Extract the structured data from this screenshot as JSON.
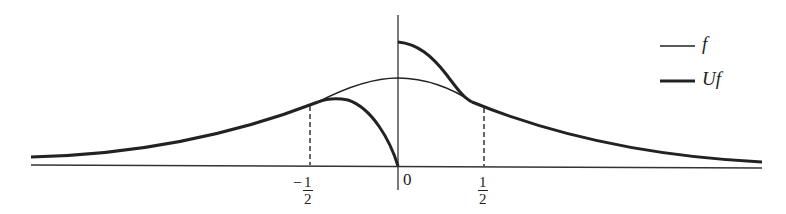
{
  "diagram": {
    "title": "",
    "colors": {
      "ink": "#222222",
      "background": "#ffffff"
    },
    "x_axis": {
      "ticks": [
        {
          "id": "neg_half",
          "sign": "−",
          "numerator": "1",
          "denominator": "2"
        },
        {
          "id": "zero",
          "text": "0"
        },
        {
          "id": "pos_half",
          "sign": "",
          "numerator": "1",
          "denominator": "2"
        }
      ]
    },
    "curves": [
      {
        "name": "f",
        "style": "thin",
        "description": "bell-shaped function centered at 0"
      },
      {
        "name": "Uf",
        "style": "thick",
        "description": "transformed function: equals f for |x|>1/2, drops to 0 at 0 from the left, jumps above f just right of 0"
      }
    ],
    "legend": {
      "items": [
        {
          "label": "f",
          "style": "thin"
        },
        {
          "label": "Uf",
          "style": "thick"
        }
      ]
    },
    "annotations": {
      "dashed_lines": [
        "x = −1/2",
        "x = 1/2"
      ]
    }
  }
}
